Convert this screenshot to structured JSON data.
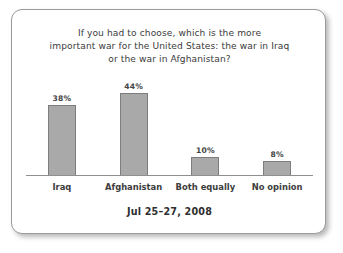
{
  "card": {
    "title_lines": [
      "If you had to choose, which is the more",
      "important war for the United States: the war in Iraq",
      "or the war in Afghanistan?"
    ],
    "caption": "Jul 25–27, 2008"
  },
  "chart_data": {
    "type": "bar",
    "title": "If you had to choose, which is the more important war for the United States: the war in Iraq or the war in Afghanistan?",
    "subtitle": "Jul 25–27, 2008",
    "categories": [
      "Iraq",
      "Afghanistan",
      "Both equally",
      "No opinion"
    ],
    "values": [
      38,
      44,
      10,
      8
    ],
    "value_labels": [
      "38%",
      "44%",
      "10%",
      "8%"
    ],
    "xlabel": "",
    "ylabel": "",
    "ylim": [
      0,
      50
    ],
    "grid": false,
    "legend": false,
    "units": "percent",
    "bar_color": "#a9a9a9",
    "bar_border_color": "#7d7d7d",
    "axis_color": "#8f8f8f"
  }
}
